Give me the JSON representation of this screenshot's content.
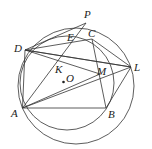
{
  "diagram": {
    "type": "geometry",
    "points": {
      "A": {
        "label": "A",
        "x": 22.5,
        "y": 108
      },
      "B": {
        "label": "B",
        "x": 106,
        "y": 108
      },
      "C": {
        "label": "C",
        "x": 92,
        "y": 39
      },
      "D": {
        "label": "D",
        "x": 25,
        "y": 50
      },
      "E": {
        "label": "E",
        "x": 71,
        "y": 36
      },
      "K": {
        "label": "K",
        "x": 58,
        "y": 62
      },
      "L": {
        "label": "L",
        "x": 131,
        "y": 67
      },
      "M": {
        "label": "M",
        "x": 100,
        "y": 74
      },
      "O": {
        "label": "O",
        "x": 63.5,
        "y": 82
      },
      "P": {
        "label": "P",
        "x": 86,
        "y": 23
      }
    },
    "circles": [
      {
        "name": "circle-O",
        "cx": 67,
        "cy": 84,
        "r": 52
      },
      {
        "name": "circle-ADL",
        "cx": 74,
        "cy": 85,
        "r": 59
      }
    ],
    "segments": [
      "AB",
      "BC",
      "CD",
      "DA",
      "AP",
      "DL",
      "DC",
      "DM",
      "AL",
      "AM",
      "BL",
      "CB",
      "DE"
    ]
  }
}
